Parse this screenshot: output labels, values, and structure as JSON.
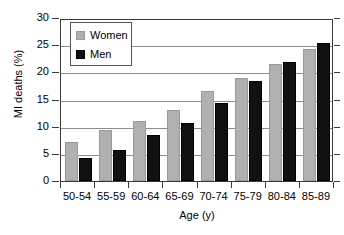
{
  "chart_data": {
    "type": "bar",
    "title": "",
    "xlabel": "Age (y)",
    "ylabel": "MI deaths (%)",
    "categories": [
      "50-54",
      "55-59",
      "60-64",
      "65-69",
      "70-74",
      "75-79",
      "80-84",
      "85-89"
    ],
    "series": [
      {
        "name": "Women",
        "color": "#b0b0b0",
        "values": [
          7.2,
          9.3,
          11.0,
          13.0,
          16.6,
          18.9,
          21.6,
          24.3
        ]
      },
      {
        "name": "Men",
        "color": "#111111",
        "values": [
          4.3,
          5.8,
          8.5,
          10.6,
          14.4,
          18.4,
          21.9,
          25.4
        ]
      }
    ],
    "ylim": [
      0,
      30
    ],
    "yticks": [
      0,
      5,
      10,
      15,
      20,
      25,
      30
    ],
    "ytick_labels": [
      "0",
      "5",
      "10",
      "15",
      "20",
      "25",
      "30"
    ],
    "grid": "horizontal",
    "legend_position": "top-left",
    "legend_entries": [
      "Women",
      "Men"
    ]
  }
}
